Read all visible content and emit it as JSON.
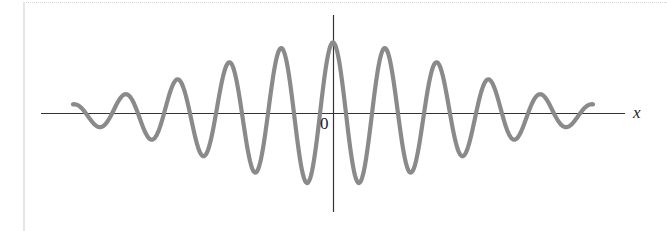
{
  "chart_data": {
    "type": "line",
    "title": "",
    "xlabel": "x",
    "ylabel": "",
    "origin_label": "0",
    "function": "y = A * exp(-(x/sigma)^2) * cos(2*pi*x/period)",
    "params": {
      "amplitude_px": 71,
      "sigma_px": 182,
      "period_px": 52
    },
    "x_range_px": [
      -260,
      260
    ],
    "peaks": [
      {
        "x": -208,
        "y": 19
      },
      {
        "x": -156,
        "y": 36
      },
      {
        "x": -104,
        "y": 54
      },
      {
        "x": -52,
        "y": 66
      },
      {
        "x": 0,
        "y": 71
      },
      {
        "x": 52,
        "y": 66
      },
      {
        "x": 104,
        "y": 54
      },
      {
        "x": 156,
        "y": 36
      },
      {
        "x": 208,
        "y": 19
      }
    ],
    "grid": false,
    "legend": null,
    "colors": {
      "curve": "#8a8a8a",
      "axes": "#333333"
    }
  },
  "labels": {
    "x_axis": "x",
    "origin": "0"
  }
}
